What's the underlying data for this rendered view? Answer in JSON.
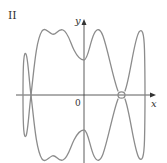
{
  "figure": {
    "panel_label": "II",
    "x_axis_label": "x",
    "y_axis_label": "y",
    "origin_label": "0",
    "curve_color": "#8c8c8c",
    "axis_color": "#333333"
  }
}
